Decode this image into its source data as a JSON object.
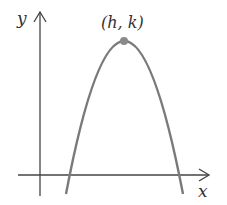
{
  "diagram": {
    "type": "parabola-graph",
    "axes": {
      "x_label": "x",
      "y_label": "y"
    },
    "vertex": {
      "label": "(h, k)"
    },
    "curve": {
      "opens": "down",
      "color": "#7a7a7a"
    },
    "vertex_color": "#8a8a8a",
    "axis_color": "#444444"
  }
}
